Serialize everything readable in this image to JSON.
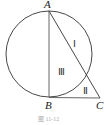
{
  "figure": {
    "points": {
      "A": {
        "label": "A",
        "x": 49,
        "y": 10
      },
      "B": {
        "label": "B",
        "x": 49,
        "y": 98
      },
      "C": {
        "label": "C",
        "x": 100,
        "y": 98
      }
    },
    "circle": {
      "cx": 49,
      "cy": 54,
      "r": 43
    },
    "regions": [
      {
        "id": "I",
        "label": "Ⅰ"
      },
      {
        "id": "II",
        "label": "Ⅱ"
      },
      {
        "id": "III",
        "label": "Ⅲ"
      }
    ],
    "caption": "图 11-12",
    "colors": {
      "stroke": "#333333",
      "background": "#ffffff"
    }
  }
}
